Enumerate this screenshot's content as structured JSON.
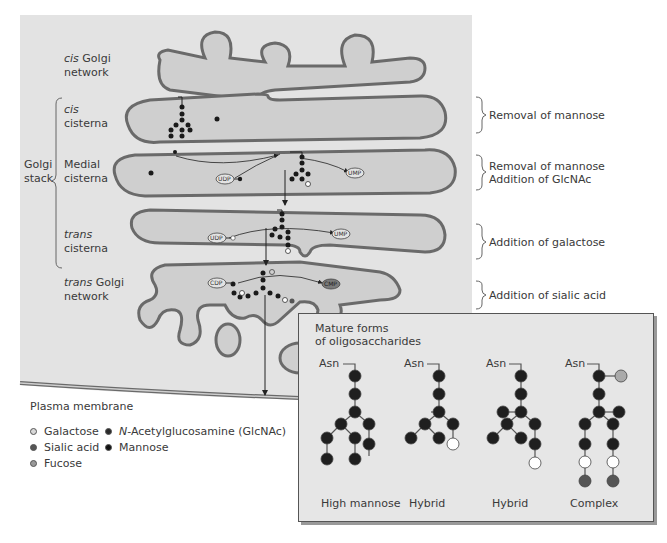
{
  "figure": {
    "stage_labels": {
      "cis_golgi_network": {
        "italic": "cis",
        "rest": " Golgi",
        "line2": "network"
      },
      "cis_cisterna": {
        "italic": "cis",
        "line2": "cisterna"
      },
      "medial_cisterna": {
        "line1": "Medial",
        "line2": "cisterna"
      },
      "trans_cisterna": {
        "italic": "trans",
        "line2": "cisterna"
      },
      "trans_golgi_network": {
        "italic": "trans",
        "rest": " Golgi",
        "line2": "network"
      },
      "golgi_stack": {
        "line1": "Golgi",
        "line2": "stack"
      }
    },
    "processes": [
      {
        "stage": "cis cisterna",
        "lines": [
          "Removal of mannose"
        ]
      },
      {
        "stage": "Medial cisterna",
        "lines": [
          "Removal of mannose",
          "Addition of GlcNAc"
        ]
      },
      {
        "stage": "trans cisterna",
        "lines": [
          "Addition of galactose"
        ]
      },
      {
        "stage": "trans Golgi network",
        "lines": [
          "Addition of sialic acid"
        ]
      }
    ],
    "nucleotide_labels": {
      "udp": "UDP",
      "ump": "UMP",
      "cdp": "CDP",
      "cmp": "CMP"
    },
    "plasma_membrane_label": "Plasma membrane",
    "legend": {
      "items": [
        {
          "label": "Galactose",
          "color": "#d8d8d8",
          "italic_prefix": ""
        },
        {
          "label": "Sialic acid",
          "color": "#555555",
          "italic_prefix": ""
        },
        {
          "label": "Fucose",
          "color": "#999999",
          "italic_prefix": ""
        },
        {
          "label": "-Acetylglucosamine (GlcNAc)",
          "color": "#2a2a2a",
          "italic_prefix": "N"
        },
        {
          "label": "Mannose",
          "color": "#111111",
          "italic_prefix": ""
        }
      ]
    },
    "mature_panel": {
      "title_line1": "Mature forms",
      "title_line2": "of oligosaccharides",
      "asn_label": "Asn",
      "forms": [
        {
          "caption": "High mannose"
        },
        {
          "caption": "Hybrid"
        },
        {
          "caption": "Hybrid"
        },
        {
          "caption": "Complex"
        }
      ]
    },
    "colors": {
      "background_panel": "#e3e3e3",
      "cisterna_fill": "#cfcfcf",
      "membrane": "#6a6a6a",
      "mannose": "#1a1a1a",
      "galactose": "#ffffff",
      "sialic_acid": "#555555",
      "fucose": "#a8a8a8"
    }
  }
}
